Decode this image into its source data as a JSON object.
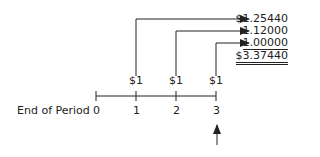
{
  "diagram": {
    "axis_label": "End of Period",
    "periods": [
      "0",
      "1",
      "2",
      "3"
    ],
    "payments": [
      "$1",
      "$1",
      "$1"
    ],
    "future_values": [
      "$1.25440",
      "1.12000",
      "1.00000"
    ],
    "total": "$3.37440"
  }
}
